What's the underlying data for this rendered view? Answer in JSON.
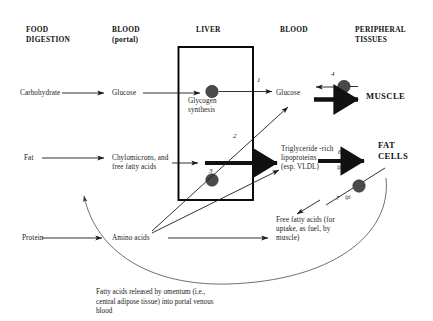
{
  "diagram": {
    "columns": [
      {
        "id": "food-digestion",
        "line1": "FOOD",
        "line2": "DIGESTION"
      },
      {
        "id": "blood-portal",
        "line1": "BLOOD",
        "line2": "(portal)"
      },
      {
        "id": "liver",
        "line1": "LIVER",
        "line2": ""
      },
      {
        "id": "blood",
        "line1": "BLOOD",
        "line2": ""
      },
      {
        "id": "peripheral-tissues",
        "line1": "PERIPHERAL",
        "line2": "TISSUES"
      }
    ],
    "nodes": {
      "carbohydrate": "Carbohydrate",
      "glucose_portal": "Glucose",
      "glycogen_synthesis": "Glycogen\nsynthesis",
      "glucose_blood": "Glucose",
      "muscle": "MUSCLE",
      "fat": "Fat",
      "chylomicrons": "Chylomicrons, and\nfree fatty acids",
      "vldl": "Triglyceride -rich\nlipoproteins\n(esp. VLDL)",
      "fat_cells": "FAT\nCELLS",
      "protein": "Protein",
      "amino_acids": "Amino acids",
      "free_fatty_acids": "Free fatty acids (for\nuptake, as fuel, by\nmuscle)"
    },
    "step_numbers": {
      "one": "1",
      "two": "2",
      "three": "3",
      "four": "4",
      "five": "5",
      "six": "6",
      "seven": "7"
    },
    "enzyme_labels": {
      "lpl_six": "lpl",
      "lpl_seven": "lpl"
    },
    "caption": "Fatty acids released by omentum (i.e.,\ncentral adipose tissue) into portal venous\nblood",
    "colors": {
      "ink": "#1a1a1a",
      "box_stroke": "#000000",
      "node_fill": "#4a4a4a",
      "thin_line": "#555555",
      "background": "#ffffff"
    }
  }
}
